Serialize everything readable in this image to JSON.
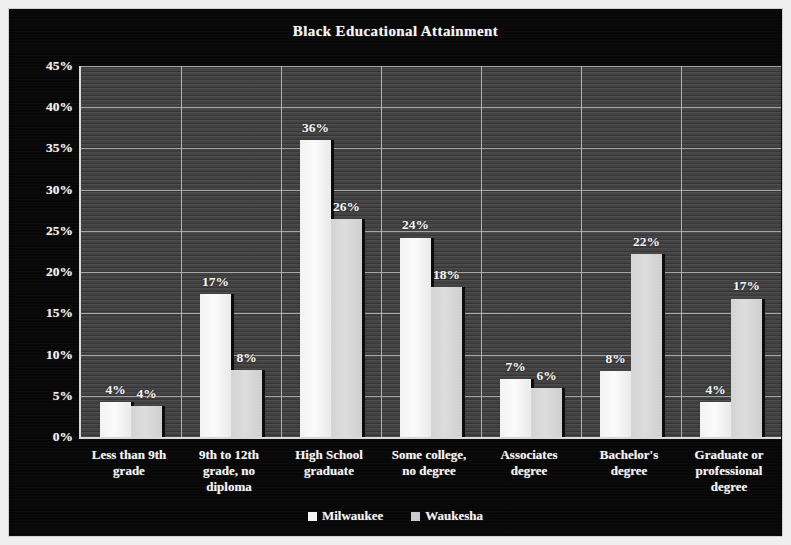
{
  "chart_data": {
    "type": "bar",
    "title": "Black Educational Attainment",
    "xlabel": "",
    "ylabel": "",
    "ylim": [
      0,
      45
    ],
    "ytick_step": 5,
    "ytick_labels": [
      "0%",
      "5%",
      "10%",
      "15%",
      "20%",
      "25%",
      "30%",
      "35%",
      "40%",
      "45%"
    ],
    "ytick_values": [
      0,
      5,
      10,
      15,
      20,
      25,
      30,
      35,
      40,
      45
    ],
    "grid": true,
    "legend_position": "bottom",
    "value_labels_suffix": "%",
    "categories": [
      "Less than 9th grade",
      "9th to 12th grade, no diploma",
      "High School graduate",
      "Some college, no degree",
      "Associates degree",
      "Bachelor's degree",
      "Graduate or professional degree"
    ],
    "category_lines": [
      [
        "Less than 9th",
        "grade"
      ],
      [
        "9th to 12th",
        "grade, no",
        "diploma"
      ],
      [
        "High School",
        "graduate"
      ],
      [
        "Some college,",
        "no degree"
      ],
      [
        "Associates",
        "degree"
      ],
      [
        "Bachelor's",
        "degree"
      ],
      [
        "Graduate or",
        "professional",
        "degree"
      ]
    ],
    "series": [
      {
        "name": "Milwaukee",
        "color": "#f7f7f7",
        "values": [
          4,
          17,
          36,
          24,
          7,
          8,
          4
        ],
        "plot_values": [
          4.3,
          17.3,
          36.0,
          24.2,
          7.0,
          8.0,
          4.3
        ],
        "labels": [
          "4%",
          "17%",
          "36%",
          "24%",
          "7%",
          "8%",
          "4%"
        ]
      },
      {
        "name": "Waukesha",
        "color": "#d6d6d6",
        "values": [
          4,
          8,
          26,
          18,
          6,
          22,
          17
        ],
        "plot_values": [
          3.8,
          8.1,
          26.4,
          18.2,
          6.0,
          22.2,
          16.8
        ],
        "labels": [
          "4%",
          "8%",
          "26%",
          "18%",
          "6%",
          "22%",
          "17%"
        ]
      }
    ]
  },
  "legend": {
    "items": [
      {
        "label": "Milwaukee"
      },
      {
        "label": "Waukesha"
      }
    ]
  }
}
